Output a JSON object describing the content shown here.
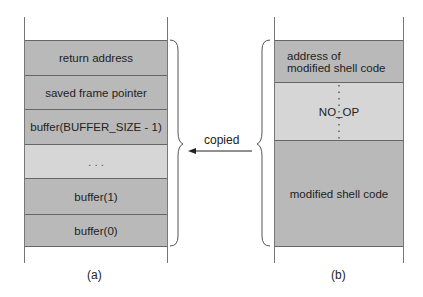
{
  "figure": {
    "left_stack": {
      "caption": "(a)",
      "cells": [
        {
          "label": "return address"
        },
        {
          "label": "saved frame pointer"
        },
        {
          "label": "buffer(BUFFER_SIZE - 1)"
        },
        {
          "label": ". . ."
        },
        {
          "label": "buffer(1)"
        },
        {
          "label": "buffer(0)"
        }
      ]
    },
    "right_stack": {
      "caption": "(b)",
      "cells": [
        {
          "label": "address of modified shell code"
        },
        {
          "label": "NO_OP"
        },
        {
          "label": "modified shell code"
        }
      ]
    },
    "arrow_label": "copied"
  }
}
